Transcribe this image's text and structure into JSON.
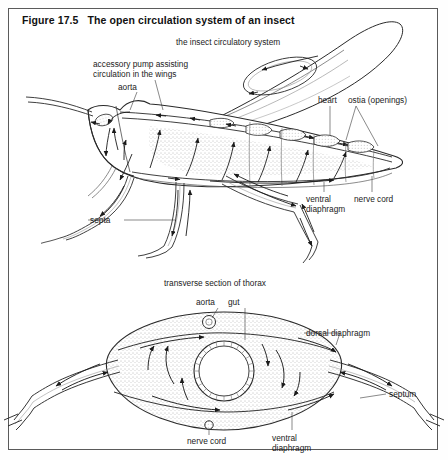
{
  "figure": {
    "title": "Figure 17.5   The open circulation system of an insect",
    "border_color": "#5a5a5a",
    "ink_color": "#1b1b1b",
    "background": "#ffffff"
  },
  "panels": {
    "top": {
      "caption": "the insect circulatory system",
      "labels": {
        "accessory_pump_line1": "accessory pump assisting",
        "accessory_pump_line2": "circulation in the wings",
        "aorta": "aorta",
        "heart": "heart",
        "ostia": "ostia (openings)",
        "ventral_line1": "ventral",
        "ventral_line2": "diaphragm",
        "nerve_cord": "nerve cord",
        "septa": "septa"
      }
    },
    "bottom": {
      "caption": "transverse section of thorax",
      "labels": {
        "aorta": "aorta",
        "gut": "gut",
        "dorsal_diaphragm": "dorsal diaphragm",
        "septum": "septum",
        "nerve_cord": "nerve cord",
        "ventral_line1": "ventral",
        "ventral_line2": "diaphragm"
      }
    }
  }
}
